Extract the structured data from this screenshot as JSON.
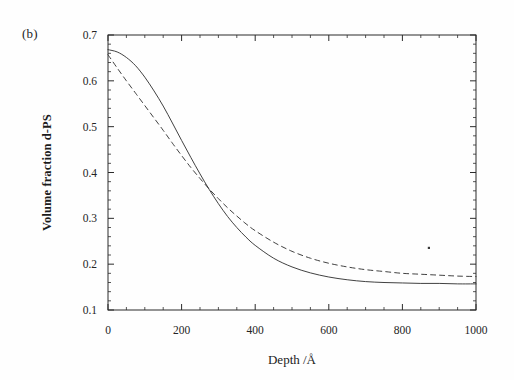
{
  "figure": {
    "panel_label": "(b)",
    "background_color": "#fefefe",
    "ink_color": "#2b2b2b"
  },
  "chart_data": {
    "type": "line",
    "title": "",
    "subtitle": "",
    "panel": "(b)",
    "xlabel": "Depth /Å",
    "ylabel": "Volume fraction d-PS",
    "xlim": [
      0,
      1000
    ],
    "ylim": [
      0.1,
      0.7
    ],
    "xticks": [
      0,
      200,
      400,
      600,
      800,
      1000
    ],
    "xtick_labels": [
      "0",
      "200",
      "400",
      "600",
      "800",
      "1000"
    ],
    "yticks": [
      0.1,
      0.2,
      0.3,
      0.4,
      0.5,
      0.6,
      0.7
    ],
    "ytick_labels": [
      "0.1",
      "0.2",
      "0.3",
      "0.4",
      "0.5",
      "0.6",
      "0.7"
    ],
    "x_minor_tick_step": 50,
    "y_minor_tick_step": 0.02,
    "grid": false,
    "legend": null,
    "frame": "box",
    "tick_direction": "in",
    "annotations": [
      {
        "name": "scan-speck",
        "x": 872,
        "y": 0.2355,
        "kind": "dust-speck"
      }
    ],
    "series": [
      {
        "name": "solid-curve",
        "style": "solid",
        "color": "#2b2b2b",
        "linewidth": 0.9,
        "x": [
          0,
          25,
          50,
          75,
          100,
          125,
          150,
          175,
          200,
          225,
          250,
          275,
          300,
          325,
          350,
          375,
          400,
          450,
          500,
          550,
          600,
          650,
          700,
          750,
          800,
          850,
          900,
          950,
          1000
        ],
        "y": [
          0.668,
          0.663,
          0.651,
          0.633,
          0.608,
          0.578,
          0.545,
          0.508,
          0.47,
          0.433,
          0.397,
          0.363,
          0.332,
          0.304,
          0.28,
          0.259,
          0.241,
          0.213,
          0.194,
          0.181,
          0.172,
          0.166,
          0.162,
          0.16,
          0.159,
          0.158,
          0.158,
          0.157,
          0.157
        ]
      },
      {
        "name": "dashed-curve",
        "style": "dashed",
        "color": "#2b2b2b",
        "linewidth": 0.9,
        "dash_pattern": "5,4",
        "x": [
          0,
          25,
          50,
          75,
          100,
          125,
          150,
          175,
          200,
          225,
          250,
          275,
          300,
          325,
          350,
          375,
          400,
          450,
          500,
          550,
          600,
          650,
          700,
          750,
          800,
          850,
          900,
          950,
          1000
        ],
        "y": [
          0.657,
          0.628,
          0.6,
          0.573,
          0.546,
          0.519,
          0.492,
          0.464,
          0.437,
          0.411,
          0.387,
          0.364,
          0.343,
          0.323,
          0.305,
          0.288,
          0.273,
          0.248,
          0.228,
          0.213,
          0.202,
          0.194,
          0.188,
          0.184,
          0.18,
          0.178,
          0.176,
          0.174,
          0.173
        ]
      }
    ]
  }
}
